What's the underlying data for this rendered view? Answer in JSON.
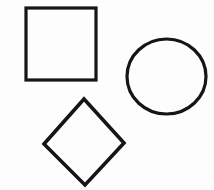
{
  "canvas": {
    "width": 214,
    "height": 190,
    "background_color": "#fdfdfd",
    "stroke_color": "#151515",
    "description": "Three black outlined geometric shapes on a plain white background"
  },
  "shapes": [
    {
      "name": "square",
      "icon": "square-icon",
      "label": "Square",
      "x": 26,
      "y": 8,
      "width": 70,
      "height": 72,
      "stroke_width": 3.2,
      "fill": "none",
      "position_note": "upper-left"
    },
    {
      "name": "circle",
      "icon": "circle-icon",
      "label": "Circle",
      "cx": 166.5,
      "cy": 76.5,
      "rx": 39.5,
      "ry": 37.5,
      "stroke_width": 3.2,
      "fill": "none",
      "position_note": "right, vertically centered"
    },
    {
      "name": "diamond",
      "icon": "diamond-icon",
      "label": "Diamond",
      "points": "84,99 124,143 85,185 44,144",
      "stroke_width": 3.6,
      "fill": "none",
      "position_note": "lower-left"
    }
  ]
}
